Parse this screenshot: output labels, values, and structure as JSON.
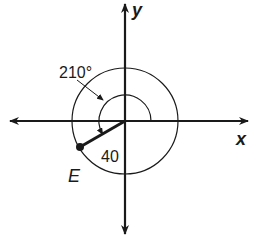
{
  "diagram": {
    "axes": {
      "x_label": "x",
      "y_label": "y"
    },
    "angle_label": "210°",
    "radius_label": "40",
    "point_label": "E",
    "colors": {
      "stroke": "#1a1a1a",
      "background": "#ffffff"
    }
  }
}
